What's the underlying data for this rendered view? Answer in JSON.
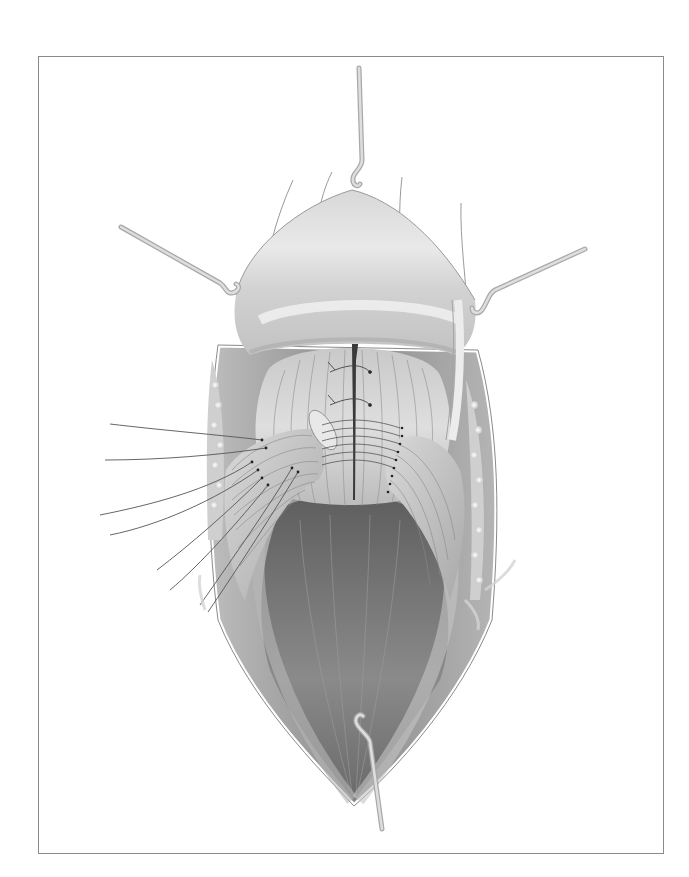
{
  "figure": {
    "type": "surgical-illustration",
    "style": "grayscale",
    "frame": {
      "x": 38,
      "y": 56,
      "width": 626,
      "height": 798,
      "border_color": "#8a8a8a"
    },
    "colors": {
      "background": "#ffffff",
      "tissue_light": "#e6e6e6",
      "tissue_mid": "#c4c4c4",
      "tissue_dark": "#7a7a7a",
      "retractor": "#c8c8c8",
      "suture": "#555555"
    },
    "elements": {
      "retractors": 4,
      "suture_strands_left": 8,
      "suture_dots_right": 9
    }
  }
}
